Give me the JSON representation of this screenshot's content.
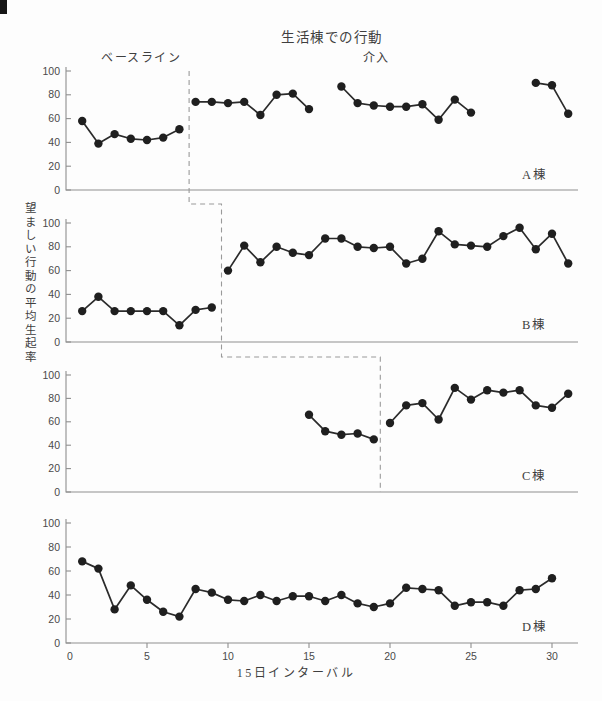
{
  "title": "生活棟での行動",
  "phase_labels": {
    "baseline": "ベースライン",
    "intervention": "介入"
  },
  "axis_titles": {
    "y": "望ましい行動の平均生起率",
    "x": "15日インターバル"
  },
  "colors": {
    "point": "#1f1f1f",
    "line": "#2b2b2b",
    "axis": "#8f8f8f",
    "dashed": "#9a9a9a",
    "text": "#3f3f3f",
    "background": "#fdfdfd"
  },
  "chart_data": {
    "type": "line",
    "title": "生活棟での行動",
    "xlabel": "15日インターバル",
    "ylabel": "望ましい行動の平均生起率",
    "xlim": [
      0,
      31.8
    ],
    "ylim": [
      0,
      100
    ],
    "y_ticks": [
      0,
      20,
      40,
      60,
      80,
      100
    ],
    "x_ticks": [
      0,
      5,
      10,
      15,
      20,
      25,
      30
    ],
    "legend": "none",
    "grid": false,
    "layout_note": "4 stacked panels sharing x axis; x tick numbers shown only on bottom panel; stepped dashed line marks start of intervention in panels A-C",
    "panels": [
      {
        "label": "A棟",
        "phase_change_x": 7.6,
        "show_x_axis_numbers": false,
        "segments": [
          {
            "phase": "baseline",
            "x": [
              1,
              2,
              3,
              4,
              5,
              6,
              7
            ],
            "y": [
              58,
              39,
              47,
              43,
              42,
              44,
              51
            ]
          },
          {
            "phase": "intervention",
            "x": [
              8,
              9,
              10,
              11,
              12,
              13,
              14,
              15
            ],
            "y": [
              74,
              74,
              73,
              74,
              63,
              80,
              81,
              68
            ]
          },
          {
            "phase": "intervention",
            "x": [
              17,
              18,
              19,
              20,
              21,
              22,
              23,
              24,
              25
            ],
            "y": [
              87,
              73,
              71,
              70,
              70,
              72,
              59,
              76,
              65
            ]
          },
          {
            "phase": "intervention",
            "x": [
              29,
              30,
              31
            ],
            "y": [
              90,
              88,
              64
            ]
          }
        ]
      },
      {
        "label": "B棟",
        "phase_change_x": 9.6,
        "show_x_axis_numbers": false,
        "segments": [
          {
            "phase": "baseline",
            "x": [
              1,
              2,
              3,
              4,
              5,
              6,
              7,
              8,
              9
            ],
            "y": [
              26,
              38,
              26,
              26,
              26,
              26,
              14,
              27,
              29
            ]
          },
          {
            "phase": "intervention",
            "x": [
              10,
              11,
              12,
              13,
              14,
              15,
              16,
              17,
              18,
              19,
              20,
              21,
              22,
              23,
              24,
              25,
              26,
              27,
              28,
              29,
              30,
              31
            ],
            "y": [
              60,
              81,
              67,
              80,
              75,
              73,
              87,
              87,
              80,
              79,
              80,
              66,
              70,
              93,
              82,
              81,
              80,
              89,
              96,
              78,
              91,
              66
            ]
          }
        ]
      },
      {
        "label": "C棟",
        "phase_change_x": 19.4,
        "show_x_axis_numbers": false,
        "segments": [
          {
            "phase": "baseline",
            "x": [
              15,
              16,
              17,
              18,
              19
            ],
            "y": [
              66,
              52,
              49,
              50,
              45
            ]
          },
          {
            "phase": "intervention",
            "x": [
              20,
              21,
              22,
              23,
              24,
              25,
              26,
              27,
              28,
              29,
              30,
              31
            ],
            "y": [
              59,
              74,
              76,
              62,
              89,
              79,
              87,
              85,
              87,
              74,
              72,
              84
            ]
          }
        ]
      },
      {
        "label": "D棟",
        "phase_change_x": null,
        "show_x_axis_numbers": true,
        "segments": [
          {
            "phase": "baseline",
            "x": [
              1,
              2,
              3,
              4,
              5,
              6,
              7,
              8,
              9,
              10,
              11,
              12,
              13,
              14,
              15,
              16,
              17,
              18,
              19,
              20,
              21,
              22,
              23,
              24,
              25,
              26,
              27,
              28,
              29,
              30
            ],
            "y": [
              68,
              62,
              28,
              48,
              36,
              26,
              22,
              45,
              42,
              36,
              35,
              40,
              35,
              39,
              39,
              35,
              40,
              33,
              30,
              33,
              46,
              45,
              44,
              31,
              34,
              34,
              31,
              44,
              45,
              54
            ]
          }
        ]
      }
    ]
  }
}
